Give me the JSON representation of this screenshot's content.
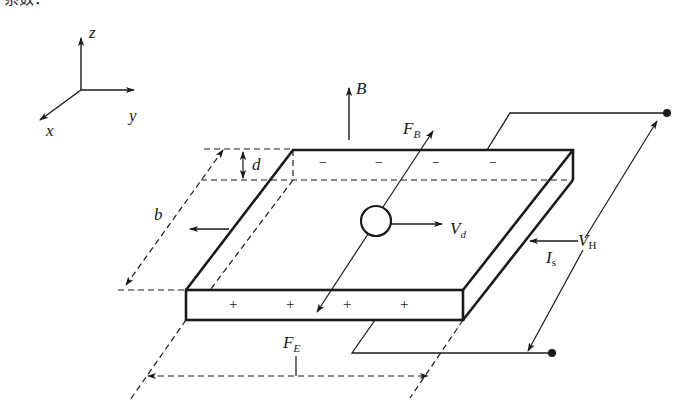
{
  "header_fragment": "系数：",
  "axes": {
    "z_label": "z",
    "y_label": "y",
    "x_label": "x"
  },
  "labels": {
    "B": "B",
    "F_B_main": "F",
    "F_B_sub": "B",
    "d": "d",
    "b": "b",
    "V_d_main": "V",
    "V_d_sub": "d",
    "I_s_main": "I",
    "I_s_sub": "s",
    "V_H_main": "V",
    "V_H_sub": "H",
    "F_E_main": "F",
    "F_E_sub": "E"
  },
  "charges": {
    "top_sign": "−",
    "bottom_sign": "+",
    "top_count": 4,
    "bottom_count": 4
  },
  "colors": {
    "ink": "#1a1a1a",
    "background": "#ffffff"
  }
}
